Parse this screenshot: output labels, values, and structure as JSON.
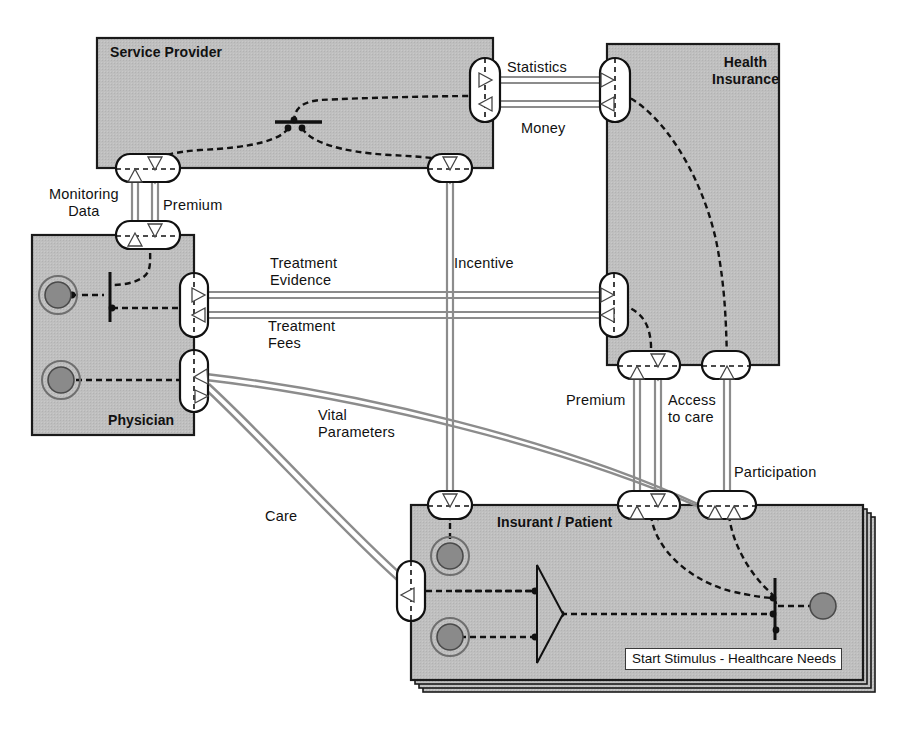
{
  "diagram": {
    "type": "uml-component-collaboration",
    "colors": {
      "component_fill": "#bfbfbf",
      "component_stroke": "#1a1a1a",
      "connector_gray": "#8c8c8c",
      "flow_black": "#111111",
      "note_fill": "#ffffff",
      "node_dark": "#808080",
      "background": "#ffffff"
    },
    "components": [
      {
        "id": "service-provider",
        "name": "Service Provider",
        "x": 97,
        "y": 38,
        "w": 396,
        "h": 130,
        "label_x": 110,
        "label_y": 44
      },
      {
        "id": "health-insurance",
        "name": "Health\nInsurance",
        "x": 607,
        "y": 44,
        "w": 172,
        "h": 321,
        "label_x": 712,
        "label_y": 54
      },
      {
        "id": "physician",
        "name": "Physician",
        "x": 32,
        "y": 235,
        "w": 162,
        "h": 200,
        "label_x": 108,
        "label_y": 412
      },
      {
        "id": "insurant-patient",
        "name": "Insurant / Patient",
        "x": 411,
        "y": 505,
        "w": 452,
        "h": 175,
        "label_x": 497,
        "label_y": 514
      }
    ],
    "note": {
      "id": "start-stimulus-note",
      "text": "Start Stimulus - Healthcare Needs",
      "x": 625,
      "y": 648
    },
    "connector_labels": [
      {
        "id": "statistics",
        "text": "Statistics",
        "x": 507,
        "y": 59
      },
      {
        "id": "money",
        "text": "Money",
        "x": 521,
        "y": 120
      },
      {
        "id": "monitoring-data",
        "text": "Monitoring\nData",
        "x": 49,
        "y": 186
      },
      {
        "id": "premium-top",
        "text": "Premium",
        "x": 163,
        "y": 197
      },
      {
        "id": "treatment-evidence",
        "text": "Treatment\nEvidence",
        "x": 270,
        "y": 255
      },
      {
        "id": "incentive",
        "text": "Incentive",
        "x": 454,
        "y": 255
      },
      {
        "id": "treatment-fees",
        "text": "Treatment\nFees",
        "x": 268,
        "y": 318
      },
      {
        "id": "vital-parameters",
        "text": "Vital\nParameters",
        "x": 318,
        "y": 407
      },
      {
        "id": "premium-bottom",
        "text": "Premium",
        "x": 566,
        "y": 392
      },
      {
        "id": "access-to-care",
        "text": "Access\nto care",
        "x": 668,
        "y": 392
      },
      {
        "id": "participation",
        "text": "Participation",
        "x": 734,
        "y": 464
      },
      {
        "id": "care",
        "text": "Care",
        "x": 265,
        "y": 508
      }
    ],
    "ports": [
      {
        "id": "sp-port-statistics-money",
        "owner": "service-provider",
        "edge": "right",
        "cx": 484,
        "cy": 90
      },
      {
        "id": "sp-port-monitoring-premium",
        "owner": "service-provider",
        "edge": "bottom",
        "cx": 143,
        "cy": 168
      },
      {
        "id": "sp-port-incentive",
        "owner": "service-provider",
        "edge": "bottom",
        "cx": 450,
        "cy": 168
      },
      {
        "id": "hi-port-statistics-money",
        "owner": "health-insurance",
        "edge": "left",
        "cx": 607,
        "cy": 90
      },
      {
        "id": "hi-port-treatment",
        "owner": "health-insurance",
        "edge": "left",
        "cx": 607,
        "cy": 303
      },
      {
        "id": "hi-port-premium-access",
        "owner": "health-insurance",
        "edge": "bottom",
        "cx": 647,
        "cy": 365
      },
      {
        "id": "hi-port-participation",
        "owner": "health-insurance",
        "edge": "bottom",
        "cx": 727,
        "cy": 365
      },
      {
        "id": "ph-port-monitoring-premium",
        "owner": "physician",
        "edge": "top",
        "cx": 148,
        "cy": 235
      },
      {
        "id": "ph-port-treatment",
        "owner": "physician",
        "edge": "right",
        "cx": 194,
        "cy": 303
      },
      {
        "id": "ph-port-care-vital",
        "owner": "physician",
        "edge": "right",
        "cx": 194,
        "cy": 380
      },
      {
        "id": "ip-port-incentive",
        "owner": "insurant-patient",
        "edge": "top",
        "cx": 450,
        "cy": 505
      },
      {
        "id": "ip-port-premium-access",
        "owner": "insurant-patient",
        "edge": "top",
        "cx": 647,
        "cy": 505
      },
      {
        "id": "ip-port-participation",
        "owner": "insurant-patient",
        "edge": "top",
        "cx": 727,
        "cy": 505
      },
      {
        "id": "ip-port-care-vital",
        "owner": "insurant-patient",
        "edge": "left",
        "cx": 411,
        "cy": 591
      }
    ],
    "connectors": [
      {
        "id": "statistics-flow",
        "from": "service-provider",
        "to": "health-insurance",
        "label": "Statistics",
        "direction": "right"
      },
      {
        "id": "money-flow",
        "from": "health-insurance",
        "to": "service-provider",
        "label": "Money",
        "direction": "left"
      },
      {
        "id": "monitoring-data-flow",
        "from": "physician",
        "to": "service-provider",
        "label": "Monitoring Data",
        "direction": "up"
      },
      {
        "id": "premium-top-flow",
        "from": "service-provider",
        "to": "physician",
        "label": "Premium",
        "direction": "down"
      },
      {
        "id": "treatment-evidence-flow",
        "from": "physician",
        "to": "health-insurance",
        "label": "Treatment Evidence",
        "direction": "right"
      },
      {
        "id": "treatment-fees-flow",
        "from": "health-insurance",
        "to": "physician",
        "label": "Treatment Fees",
        "direction": "left"
      },
      {
        "id": "incentive-flow",
        "from": "service-provider",
        "to": "insurant-patient",
        "label": "Incentive",
        "direction": "down"
      },
      {
        "id": "premium-bottom-flow",
        "from": "insurant-patient",
        "to": "health-insurance",
        "label": "Premium",
        "direction": "up"
      },
      {
        "id": "access-to-care-flow",
        "from": "health-insurance",
        "to": "insurant-patient",
        "label": "Access to care",
        "direction": "down"
      },
      {
        "id": "participation-flow",
        "from": "insurant-patient",
        "to": "health-insurance",
        "label": "Participation",
        "direction": "up"
      },
      {
        "id": "vital-parameters-flow",
        "from": "insurant-patient",
        "to": "physician",
        "label": "Vital Parameters",
        "direction": "up-left"
      },
      {
        "id": "care-flow",
        "from": "physician",
        "to": "insurant-patient",
        "label": "Care",
        "direction": "down-right"
      }
    ]
  }
}
